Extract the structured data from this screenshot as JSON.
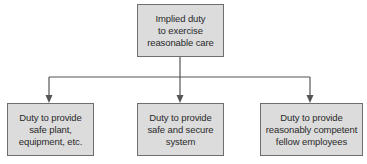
{
  "diagram": {
    "root": {
      "label": "Implied duty\nto exercise\nreasonable care"
    },
    "children": [
      {
        "label": "Duty to provide\nsafe plant,\nequipment, etc."
      },
      {
        "label": "Duty to provide\nsafe and secure\nsystem"
      },
      {
        "label": "Duty to provide\nreasonably competent\nfellow employees"
      }
    ],
    "colors": {
      "box_fill": "#dcdcdc",
      "border": "#6e6e6e",
      "connector": "#555555"
    }
  }
}
